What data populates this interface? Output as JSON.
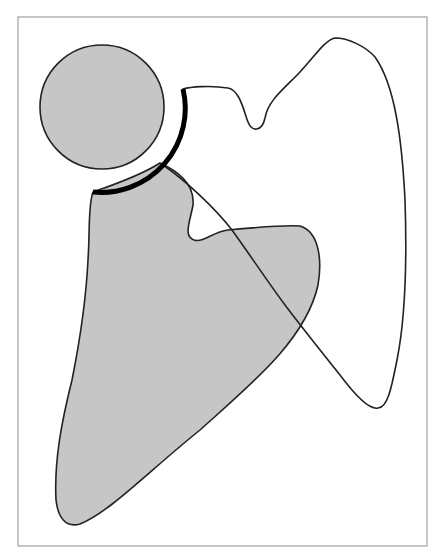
{
  "figure": {
    "width": 440,
    "height": 559,
    "background": "#ffffff",
    "frame": {
      "x": 18,
      "y": 17,
      "width": 409,
      "height": 529,
      "stroke": "#b4b4b4",
      "stroke_width": 1.5
    },
    "colors": {
      "fill_gray": "#c6c6c6",
      "stroke_dark": "#222222",
      "arc_black": "#000000"
    },
    "shapes": {
      "circle": {
        "cx": 102,
        "cy": 107,
        "r": 62
      },
      "thick_arc": {
        "d": "M 183 89 A 84 84 0 0 1 93 192",
        "stroke_width": 5
      },
      "gray_blob": {
        "d": "M 93 192 C 110 186 140 176 160 163 C 175 170 195 182 193 205 C 190 222 183 236 194 240 C 204 243 212 232 228 230 C 260 227 285 225 300 226 C 320 232 322 262 318 285 C 306 340 250 385 200 430 C 150 470 110 512 80 524 C 66 528 58 518 56 500 C 54 460 62 420 72 380 C 80 340 86 300 88 260 C 90 230 88 205 93 192 Z"
      },
      "open_curve": {
        "d": "M 183 89 C 190 87 210 85 228 88 C 240 90 244 112 248 122 C 252 132 262 132 265 118 C 268 100 285 88 300 72 C 315 56 325 40 335 38 C 348 38 365 46 375 57 C 395 85 402 140 405 200 C 407 260 405 320 397 360 C 392 385 388 408 378 408 C 370 410 355 395 340 375 C 320 350 300 325 285 305 C 270 285 250 255 232 230 C 215 208 185 180 163 165"
      }
    }
  }
}
